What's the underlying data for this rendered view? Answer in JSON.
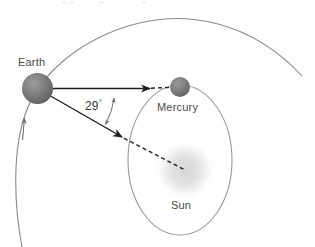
{
  "diagram": {
    "type": "astronomy-orbital-diagram",
    "background_color": "#ffffff",
    "width": 315,
    "height": 247
  },
  "labels": {
    "earth": "Earth",
    "mercury": "Mercury",
    "sun": "Sun",
    "angle_value": "29",
    "angle_unit": "°"
  },
  "bodies": [
    {
      "name": "Earth",
      "label": "Earth",
      "cx": 37.5,
      "cy": 88.5,
      "r": 15.5,
      "fill_center": "#8e8e8e",
      "fill_edge": "#5e5e5e",
      "label_x": 18,
      "label_y": 56
    },
    {
      "name": "Mercury",
      "label": "Mercury",
      "cx": 180,
      "cy": 87,
      "r": 10,
      "fill_center": "#8d8d8d",
      "fill_edge": "#646464",
      "label_x": 157,
      "label_y": 101
    },
    {
      "name": "Sun",
      "label": "Sun",
      "cx": 185,
      "cy": 170,
      "r": 27,
      "fill_center": "#e2e2e2",
      "fill_edge": "#ffffff",
      "label_x": 171,
      "label_y": 199
    }
  ],
  "orbits": [
    {
      "name": "earth-orbit",
      "shape": "arc",
      "stroke": "#8a8a8a",
      "stroke_width": 1,
      "description": "Earth orbital path arc sweeping from lower-left up and over to the right edge",
      "direction_arrow": "counterclockwise",
      "arrow_at_x": 24,
      "arrow_at_y": 128
    },
    {
      "name": "mercury-orbit",
      "shape": "ellipse",
      "cx": 180,
      "cy": 160,
      "rx": 52,
      "ry": 75,
      "stroke": "#9a9a9a",
      "stroke_width": 1
    }
  ],
  "sight_lines": [
    {
      "name": "line-of-sight-to-mercury",
      "from_x": 37.5,
      "from_y": 88.5,
      "to_solid_x": 150,
      "to_solid_y": 88.5,
      "to_dashed_x": 180,
      "to_dashed_y": 87,
      "stroke": "#1f1f1f",
      "stroke_width": 1.4,
      "arrowhead": true,
      "dashed_tail": true
    },
    {
      "name": "line-of-sight-to-sun",
      "from_x": 37.5,
      "from_y": 88.5,
      "to_solid_x": 122,
      "to_solid_y": 137,
      "to_dashed_x": 185,
      "to_dashed_y": 170,
      "stroke": "#1f1f1f",
      "stroke_width": 1.4,
      "arrowhead": true,
      "dashed_tail": true
    }
  ],
  "angle_marker": {
    "name": "elongation-angle",
    "value": "29",
    "unit": "°",
    "display": "29°",
    "vertex_x": 37.5,
    "vertex_y": 88.5,
    "radius": 78,
    "double_headed": true,
    "stroke": "#6f6f6f",
    "label_x": 85,
    "label_y": 98
  },
  "colors": {
    "ink": "#1f1f1f",
    "orbit_stroke": "#8a8a8a",
    "label_text": "#4a4a4a",
    "earth_body": "#6b6b6b",
    "mercury_body": "#757575",
    "sun_glow": "#e2e2e2",
    "background": "#ffffff"
  }
}
